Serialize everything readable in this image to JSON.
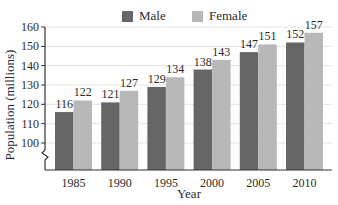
{
  "chart_data": {
    "type": "bar",
    "title": "",
    "xlabel": "Year",
    "ylabel": "Population (millions)",
    "categories": [
      "1985",
      "1990",
      "1995",
      "2000",
      "2005",
      "2010"
    ],
    "series": [
      {
        "name": "Male",
        "color": "#666666",
        "values": [
          116,
          121,
          129,
          138,
          147,
          152
        ]
      },
      {
        "name": "Female",
        "color": "#b8b8b8",
        "values": [
          122,
          127,
          134,
          143,
          151,
          157
        ]
      }
    ],
    "yticks": [
      100,
      110,
      120,
      130,
      140,
      150,
      160
    ],
    "ylim": [
      90,
      160
    ],
    "axis_break": true,
    "grid": true,
    "data_labels": true,
    "legend_position": "top"
  },
  "legend": {
    "male_label": "Male",
    "female_label": "Female"
  },
  "axes": {
    "x_label": "Year",
    "y_label": "Population (millions)"
  }
}
